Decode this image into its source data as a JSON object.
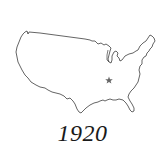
{
  "map": {
    "title": "United States outline",
    "year": "1920",
    "marker": {
      "icon": "star-icon",
      "label": "Center of population",
      "x": 109,
      "y": 80,
      "color": "#666666"
    },
    "outline_color": "#222222",
    "background": "#ffffff"
  }
}
